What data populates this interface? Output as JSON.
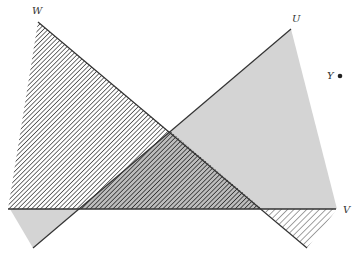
{
  "diagram": {
    "type": "geometric-figure",
    "labels": {
      "W": "W",
      "U": "U",
      "Y": "Y",
      "V": "V"
    },
    "points": {
      "W": [
        38,
        22
      ],
      "U": [
        291,
        29
      ],
      "Y": [
        340,
        76
      ],
      "V_line_end": [
        335,
        209
      ],
      "crossing": [
        170,
        131
      ]
    },
    "regions": [
      {
        "name": "hatched-triangle-W",
        "fill": "diagonal-hatch"
      },
      {
        "name": "gray-triangle-U",
        "fill": "light-gray"
      },
      {
        "name": "overlap-region",
        "fill": "hatch-over-gray"
      },
      {
        "name": "lower-left-gray-wedge",
        "fill": "light-gray"
      },
      {
        "name": "lower-right-hatched-wedge",
        "fill": "diagonal-hatch"
      }
    ],
    "colors": {
      "line": "#333333",
      "gray_fill": "#d4d4d4",
      "hatch": "#444444",
      "background": "#ffffff"
    }
  }
}
